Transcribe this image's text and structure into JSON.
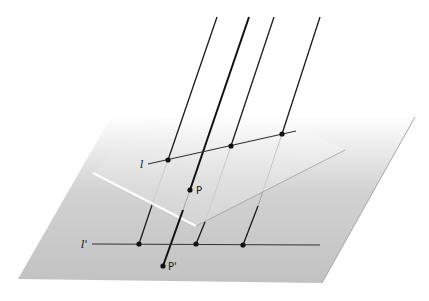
{
  "diagram": {
    "colors": {
      "ground_plane": "#c8c8c8",
      "ground_fade": "#ffffff",
      "inclined_plane": "#d4d4d4",
      "line": "#1a1a1a",
      "edge_highlight": "#ffffff"
    },
    "labels": {
      "line_l": "l",
      "line_l_prime": "l'",
      "point_p": "P",
      "point_p_prime": "P'"
    },
    "ground_plane": {
      "points": "18,279 322,283 415,117 112,115"
    },
    "inclined_plane": {
      "points": "93,173 196,226 345,150 260,110 150,125"
    },
    "line_l": {
      "x1": 148,
      "y1": 164,
      "x2": 296,
      "y2": 131
    },
    "line_l_prime": {
      "x1": 92,
      "y1": 244,
      "x2": 320,
      "y2": 245
    },
    "projection_rays": [
      {
        "x1": 217,
        "y1": 17,
        "x2": 139,
        "y2": 244,
        "on_l": [
          168,
          160
        ],
        "on_l_prime": [
          139,
          244
        ]
      },
      {
        "x1": 274,
        "y1": 17,
        "x2": 196,
        "y2": 244,
        "on_l": [
          231,
          146
        ],
        "on_l_prime": [
          196,
          244
        ]
      },
      {
        "x1": 320,
        "y1": 17,
        "x2": 243,
        "y2": 245,
        "on_l": [
          282,
          134
        ],
        "on_l_prime": [
          243,
          245
        ]
      }
    ],
    "ray_p": {
      "x1": 249,
      "y1": 17,
      "x2": 163,
      "y2": 266
    },
    "point_p": {
      "cx": 190,
      "cy": 190
    },
    "point_p_prime": {
      "cx": 163,
      "cy": 266
    }
  }
}
